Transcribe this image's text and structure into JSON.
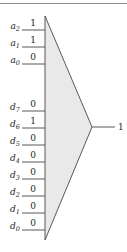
{
  "figure": {
    "kind": "8-to-1 multiplexer logic diagram",
    "top_rule": "horizontal-rule",
    "body_fill": "#e9e9e9",
    "line_color": "#58595b",
    "text_color": "#231f20"
  },
  "select_inputs": [
    {
      "name": "a",
      "sub": "2",
      "label_y": 27,
      "line_y": 30,
      "value": "1"
    },
    {
      "name": "a",
      "sub": "1",
      "label_y": 44,
      "line_y": 47,
      "value": "1"
    },
    {
      "name": "a",
      "sub": "0",
      "label_y": 61,
      "line_y": 64,
      "value": "0"
    }
  ],
  "data_inputs": [
    {
      "name": "d",
      "sub": "7",
      "label_y": 108,
      "line_y": 111,
      "value": "0"
    },
    {
      "name": "d",
      "sub": "6",
      "label_y": 125,
      "line_y": 128,
      "value": "1"
    },
    {
      "name": "d",
      "sub": "5",
      "label_y": 142,
      "line_y": 145,
      "value": "0"
    },
    {
      "name": "d",
      "sub": "4",
      "label_y": 159,
      "line_y": 162,
      "value": "0"
    },
    {
      "name": "d",
      "sub": "3",
      "label_y": 176,
      "line_y": 179,
      "value": "0"
    },
    {
      "name": "d",
      "sub": "2",
      "label_y": 193,
      "line_y": 196,
      "value": "0"
    },
    {
      "name": "d",
      "sub": "1",
      "label_y": 210,
      "line_y": 213,
      "value": "0"
    },
    {
      "name": "d",
      "sub": "0",
      "label_y": 227,
      "line_y": 230,
      "value": "0"
    }
  ],
  "output": {
    "label": "1",
    "line_y": 127,
    "label_x": 118,
    "label_y": 123
  },
  "geometry": {
    "body_left": 45,
    "body_top": 16,
    "body_bottom": 240,
    "apex_x": 92,
    "apex_y": 127,
    "stub_left": 22,
    "out_line_end": 115
  }
}
